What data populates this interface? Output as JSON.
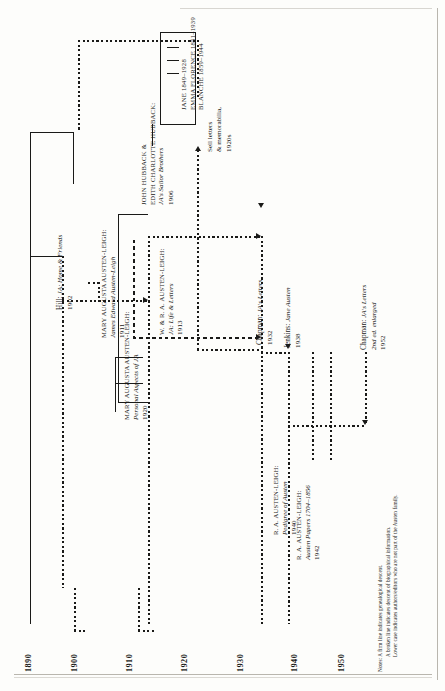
{
  "figure": {
    "orientation": "rotated-90-ccw",
    "kind": "genealogical and bibliographic descent chart"
  },
  "axis": {
    "label": "years",
    "ticks": [
      "1890",
      "1900",
      "1910",
      "1920",
      "1930",
      "1940",
      "1950"
    ]
  },
  "notes": {
    "label": "Notes:",
    "lines": [
      "A firm line indicates genealogical descent.",
      "A broken line indicates descent of biographical information.",
      "Lower case indicates authors/editors who are not part of the Austen family."
    ]
  },
  "entries": [
    {
      "id": "hill-1902",
      "name": "Hill:",
      "name_case": "lower",
      "title": "JA: Home & Friends",
      "year": "1902"
    },
    {
      "id": "hubback-1906",
      "name_line1": "John Hubback &",
      "name_line2": "Edith Charlotte Hubback:",
      "name_case": "caps",
      "title": "JA's Sailor Brothers",
      "year": "1906"
    },
    {
      "id": "mal-jeal-1911",
      "name": "Mary Augusta Austen-Leigh:",
      "name_case": "caps",
      "title": "James Edward Austen-Leigh",
      "year": "1911"
    },
    {
      "id": "wral-1913",
      "name": "W. & R. A. Austen-Leigh:",
      "name_case": "caps",
      "title": "JA: Life & Letters",
      "year": "1913"
    },
    {
      "id": "mal-personal-1920",
      "name": "Mary Augusta Austen-Leigh:",
      "name_case": "caps",
      "title": "Personal Aspects of JA",
      "year": "1920"
    },
    {
      "id": "sell-1920s",
      "name_line1": "Sell letters",
      "name_line2": "& memorabilia,",
      "name_case": "lower",
      "year": "1920s"
    },
    {
      "id": "chapman-letters-1932",
      "name": "Chapman:",
      "name_case": "lower",
      "title": "JA's Letters",
      "year": "1932"
    },
    {
      "id": "jenkins-1938",
      "name": "Jenkins:",
      "name_case": "lower",
      "title": "Jane Austen",
      "year": "1938"
    },
    {
      "id": "ral-pedigree-1940",
      "name": "R. A. Austen-Leigh:",
      "name_case": "caps",
      "title": "Pedigree of Austen",
      "year": "1940"
    },
    {
      "id": "ral-papers-1942",
      "name": "R. A. Austen-Leigh:",
      "name_case": "caps",
      "title": "Austen Papers 1704–1856",
      "year": "1942"
    },
    {
      "id": "chapman-letters-1952",
      "name": "Chapman:",
      "name_case": "lower",
      "title_line1": "JA's Letters",
      "title_line2": "2nd ed. enlarged",
      "year": "1952"
    }
  ],
  "siblings": {
    "label": "Hubback daughters",
    "people": [
      "Jane 1849–1928",
      "Emma Florence 1851–1939",
      "Blanche 1859–1944"
    ]
  },
  "colors": {
    "ink": "#1a1a18",
    "paper": "#fdfdfb",
    "edge": "#b9b6ae"
  }
}
